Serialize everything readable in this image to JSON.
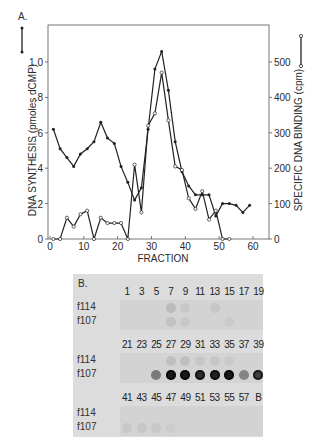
{
  "chart_data": [
    {
      "panel": "A.",
      "type": "line",
      "xlabel": "FRACTION",
      "ylabel_left": "DNA SYNTHESIS (pmoles dCMP)",
      "ylabel_right": "SPECIFIC DNA BINDING (cpm)",
      "xlim": [
        0,
        65
      ],
      "ylim_left": [
        0,
        1.2
      ],
      "ylim_right": [
        0,
        600
      ],
      "x_ticks": [
        "0",
        "10",
        "20",
        "30",
        "40",
        "50",
        "60"
      ],
      "x_tick_values": [
        0,
        10,
        20,
        30,
        40,
        50,
        60
      ],
      "y_left_ticks": [
        "0",
        ".2",
        ".4",
        ".6",
        ".8",
        "1.0"
      ],
      "y_left_tick_values": [
        0,
        0.2,
        0.4,
        0.6,
        0.8,
        1.0
      ],
      "y_right_ticks": [
        "0",
        "100",
        "200",
        "300",
        "400",
        "500"
      ],
      "y_right_tick_values": [
        0,
        100,
        200,
        300,
        400,
        500
      ],
      "grid": false,
      "series": [
        {
          "name": "DNA synthesis",
          "marker": "closed-circle",
          "axis": "left",
          "x": [
            1,
            3,
            5,
            7,
            9,
            11,
            13,
            15,
            17,
            19,
            21,
            23,
            25,
            27,
            29,
            31,
            33,
            35,
            37,
            39,
            41,
            43,
            45,
            47,
            49,
            51,
            53,
            55,
            57,
            59
          ],
          "y": [
            0.62,
            0.51,
            0.46,
            0.41,
            0.48,
            0.51,
            0.55,
            0.66,
            0.57,
            0.54,
            0.41,
            0.32,
            0.22,
            0.29,
            0.62,
            0.96,
            1.06,
            0.84,
            0.55,
            0.38,
            0.3,
            0.25,
            0.25,
            0.25,
            0.13,
            0.2,
            0.2,
            0.19,
            0.15,
            0.19
          ]
        },
        {
          "name": "Specific DNA binding",
          "marker": "open-circle",
          "axis": "right",
          "x": [
            1,
            3,
            5,
            7,
            9,
            11,
            13,
            15,
            17,
            19,
            21,
            23,
            25,
            27,
            29,
            31,
            33,
            35,
            37,
            39,
            41,
            43,
            45,
            47,
            49,
            51,
            53
          ],
          "y": [
            0,
            0,
            60,
            35,
            70,
            80,
            0,
            60,
            45,
            45,
            45,
            0,
            210,
            75,
            320,
            355,
            470,
            335,
            205,
            195,
            115,
            85,
            135,
            55,
            80,
            0,
            0
          ]
        }
      ]
    },
    {
      "panel": "B.",
      "type": "table",
      "title": "Dot blot",
      "row_labels": [
        "f114",
        "f107"
      ],
      "blocks": [
        {
          "columns": [
            "1",
            "3",
            "5",
            "7",
            "9",
            "11",
            "13",
            "15",
            "17",
            "19"
          ],
          "f114": [
            0,
            0,
            0,
            0.12,
            0.05,
            0,
            0.06,
            0,
            0,
            0
          ],
          "f107": [
            0,
            0,
            0,
            0.08,
            0.05,
            0,
            0,
            0.04,
            0,
            0
          ]
        },
        {
          "columns": [
            "21",
            "23",
            "25",
            "27",
            "29",
            "31",
            "33",
            "35",
            "37",
            "39"
          ],
          "f114": [
            0,
            0,
            0,
            0.1,
            0.1,
            0.06,
            0.06,
            0.04,
            0,
            0
          ],
          "f107": [
            0,
            0,
            0.45,
            0.95,
            0.95,
            0.85,
            0.9,
            0.95,
            0.4,
            0.75
          ]
        },
        {
          "columns": [
            "41",
            "43",
            "45",
            "47",
            "49",
            "51",
            "53",
            "55",
            "57",
            "B"
          ],
          "f114": [
            0,
            0,
            0,
            0,
            0,
            0,
            0,
            0,
            0,
            0
          ],
          "f107": [
            0.05,
            0.05,
            0.05,
            0.03,
            0,
            0,
            0,
            0,
            0,
            0
          ]
        }
      ]
    }
  ],
  "legend": {
    "left_marker": "closed-circle line",
    "right_marker": "open-circle line"
  }
}
